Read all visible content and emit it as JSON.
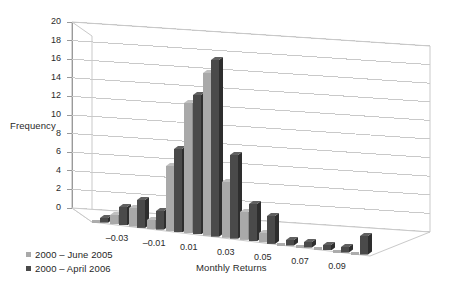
{
  "chart_data": {
    "type": "bar",
    "title": "",
    "subtitle": "",
    "xlabel": "Monthly Returns",
    "ylabel": "Frequency",
    "ylim": [
      0,
      20
    ],
    "ytick_step": 2,
    "yticks": [
      "20",
      "18",
      "16",
      "14",
      "12",
      "10",
      "8",
      "6",
      "4",
      "2",
      "0"
    ],
    "xticks": [
      "-0.03",
      "-0.01",
      "0.01",
      "0.03",
      "0.05",
      "0.07",
      "0.09"
    ],
    "grid": true,
    "legend_position": "bottom-left",
    "projection": "3d-perspective",
    "categories": [
      "-0.04",
      "-0.03",
      "-0.02",
      "-0.01",
      "0.00",
      "0.01",
      "0.02",
      "0.03",
      "0.04",
      "0.05",
      "0.06",
      "0.07",
      "0.08",
      "0.09",
      "0.10"
    ],
    "series": [
      {
        "name": "2000 – June 2005",
        "color": "#a9a9a9",
        "values": [
          0,
          1,
          2,
          1,
          7,
          14,
          17.5,
          6,
          3,
          1,
          0,
          0,
          0,
          0,
          0
        ]
      },
      {
        "name": "2000 – April 2006",
        "color": "#4a4a4a",
        "values": [
          0.5,
          2,
          3,
          2,
          9,
          15,
          19,
          9,
          4,
          3,
          0.6,
          0.6,
          0.6,
          0.6,
          2
        ]
      }
    ]
  },
  "legend": {
    "items": [
      {
        "label": "2000 – June 2005",
        "color": "#a9a9a9"
      },
      {
        "label": "2000 – April 2006",
        "color": "#4a4a4a"
      }
    ]
  },
  "axes": {
    "y_title": "Frequency",
    "x_title": "Monthly Returns"
  },
  "colors": {
    "series_light": "#a9a9a9",
    "series_dark": "#4a4a4a",
    "grid": "#c9c9c9",
    "axis": "#8f8f8f",
    "floor": "#ffffff",
    "text": "#1f1f1f"
  }
}
